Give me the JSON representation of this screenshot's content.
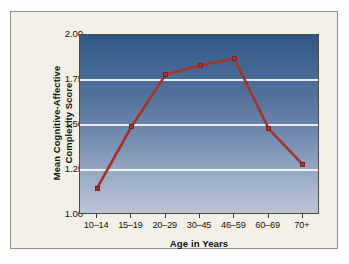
{
  "figure": {
    "panel_background": "#f3f1e7",
    "panel_border_color": "#8e8e88"
  },
  "chart_data": {
    "type": "line",
    "title": "",
    "subtitle": "",
    "xlabel": "Age in Years",
    "ylabel": "Mean Cognitive-Affective Complexity Score",
    "ylabel_line1": "Mean Cognitive-Affective",
    "ylabel_line2": "Complexity Score",
    "categories": [
      "10–14",
      "15–19",
      "20–29",
      "30–45",
      "46–59",
      "60–69",
      "70+"
    ],
    "values": [
      1.15,
      1.49,
      1.78,
      1.83,
      1.87,
      1.48,
      1.28
    ],
    "ylim": [
      1.0,
      2.0
    ],
    "yticks": [
      "2.00",
      "1.75",
      "1.50",
      "1.25",
      "1.00"
    ],
    "ytick_values": [
      2.0,
      1.75,
      1.5,
      1.25,
      1.0
    ],
    "gridlines": [
      1.75,
      1.5,
      1.25
    ],
    "grid": true,
    "legend": false,
    "legend_position": "none",
    "series_color": "#a83228",
    "marker_shape": "square",
    "plot_gradient_top": "#2f5583",
    "plot_gradient_bottom": "#bcc5d6",
    "gridline_color": "#f4f6f8",
    "axis_color": "#4a4a4a"
  }
}
